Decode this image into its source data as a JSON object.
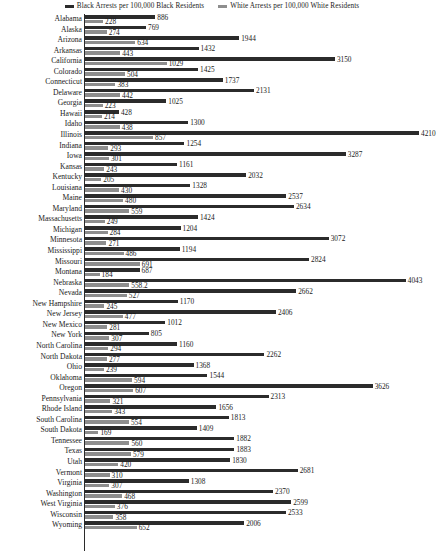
{
  "chart": {
    "type": "bar",
    "title": "",
    "legend": {
      "position": "top-center",
      "entries": [
        {
          "label": "Black Arrests per 100,000 Black Residents",
          "color": "#2b2b2b",
          "key": "black"
        },
        {
          "label": "White Arrests per 100,000 White Residents",
          "color": "#8e8e8e",
          "key": "white"
        }
      ]
    }
  },
  "chart_data": {
    "type": "bar",
    "orientation": "horizontal",
    "title": "",
    "subtitle": "",
    "xlabel": "",
    "ylabel": "",
    "grid": false,
    "legend_position": "top-center",
    "xlim": [
      0,
      4210
    ],
    "categories": [
      "Alabama",
      "Alaska",
      "Arizona",
      "Arkansas",
      "California",
      "Colorado",
      "Connecticut",
      "Delaware",
      "Georgia",
      "Hawaii",
      "Idaho",
      "Illinois",
      "Indiana",
      "Iowa",
      "Kansas",
      "Kentucky",
      "Louisiana",
      "Maine",
      "Maryland",
      "Massachusetts",
      "Michigan",
      "Minnesota",
      "Mississippi",
      "Missouri",
      "Montana",
      "Nebraska",
      "Nevada",
      "New Hampshire",
      "New Jersey",
      "New Mexico",
      "New York",
      "North Carolina",
      "North Dakota",
      "Ohio",
      "Oklahoma",
      "Oregon",
      "Pennsylvania",
      "Rhode Island",
      "South Carolina",
      "South Dakota",
      "Tennessee",
      "Texas",
      "Utah",
      "Vermont",
      "Virginia",
      "Washington",
      "West Virginia",
      "Wisconsin",
      "Wyoming"
    ],
    "series": [
      {
        "name": "Black Arrests per 100,000 Black Residents",
        "color": "#2b2b2b",
        "values": [
          886,
          769,
          1944,
          1432,
          3150,
          1425,
          1737,
          2131,
          1025,
          428,
          1300,
          4210,
          1254,
          3287,
          1161,
          2032,
          1328,
          2537,
          2634,
          1424,
          1204,
          3072,
          1194,
          2824,
          687,
          4043,
          2662,
          1170,
          2406,
          1012,
          805,
          1160,
          2262,
          1368,
          1544,
          3626,
          2313,
          1656,
          1813,
          1409,
          1882,
          1883,
          1830,
          2681,
          1308,
          2370,
          2599,
          2533,
          2006
        ]
      },
      {
        "name": "White Arrests per 100,000 White Residents",
        "color": "#8e8e8e",
        "values": [
          228,
          274,
          634,
          443,
          1029,
          504,
          383,
          442,
          223,
          214,
          438,
          857,
          293,
          301,
          243,
          205,
          430,
          480,
          559,
          249,
          284,
          271,
          486,
          691,
          184,
          558.2,
          527,
          245,
          477,
          281,
          307,
          294,
          277,
          239,
          594,
          607,
          321,
          343,
          554,
          169,
          560,
          579,
          420,
          310,
          307,
          468,
          376,
          358,
          652
        ]
      }
    ]
  }
}
